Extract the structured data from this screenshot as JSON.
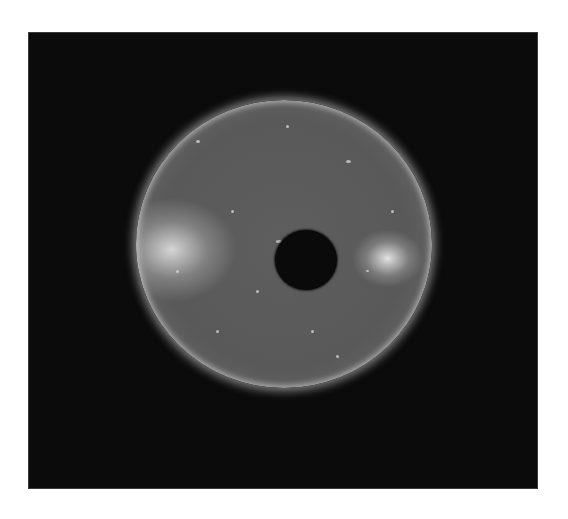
{
  "image": {
    "subject": "solar-disk",
    "description": "Grayscale EUV image of the Sun with a dark circular occulter in the center and two bright active regions on the left and right limbs",
    "colors": {
      "page_background": "#ffffff",
      "space_background": "#0b0b0b",
      "disk_base": "#5e5e5e",
      "limb_glow": "#e0e0e0",
      "occulter": "#0a0a0a"
    },
    "features": [
      {
        "name": "active-region-east",
        "position": "left limb"
      },
      {
        "name": "active-region-west",
        "position": "right limb"
      },
      {
        "name": "occulting-disk",
        "position": "center-right"
      }
    ]
  }
}
